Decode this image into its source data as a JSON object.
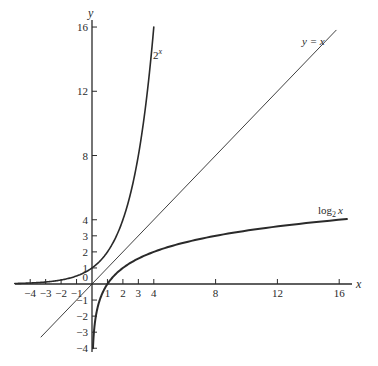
{
  "chart_data": {
    "type": "line",
    "title": "",
    "xlabel": "x",
    "ylabel": "y",
    "xlim": [
      -5,
      17
    ],
    "ylim": [
      -4.2,
      16.5
    ],
    "grid": false,
    "legend": "inline labels",
    "x_ticks": [
      -4,
      -3,
      -2,
      -1,
      1,
      2,
      3,
      4,
      8,
      12,
      16
    ],
    "y_ticks": [
      -4,
      -3,
      -2,
      -1,
      0,
      1,
      2,
      3,
      4,
      8,
      12,
      16
    ],
    "series": [
      {
        "name": "2^x",
        "label_base": "2",
        "label_sup": "x",
        "function": "2^x",
        "x": [
          -5,
          -4,
          -3,
          -2,
          -1,
          0,
          1,
          2,
          3,
          4
        ],
        "y": [
          0.031,
          0.0625,
          0.125,
          0.25,
          0.5,
          1,
          2,
          4,
          8,
          16
        ],
        "stroke_width": 1.6
      },
      {
        "name": "y = x",
        "function": "x",
        "x": [
          -3.3,
          15.8
        ],
        "y": [
          -3.3,
          15.8
        ],
        "stroke_width": 0.9
      },
      {
        "name": "log2 x",
        "label_base": "log",
        "label_sub": "2",
        "label_var": "x",
        "function": "log2(x)",
        "x": [
          0.0625,
          0.125,
          0.25,
          0.5,
          1,
          2,
          4,
          8,
          12,
          16.5
        ],
        "y": [
          -4,
          -3,
          -2,
          -1,
          0,
          1,
          2,
          3,
          3.585,
          4.04
        ],
        "stroke_width": 2.0
      }
    ]
  },
  "labels": {
    "x_axis": "x",
    "y_axis": "y",
    "origin": "0",
    "exp_curve_base": "2",
    "exp_curve_sup": "x",
    "identity_line": "y = x",
    "log_curve_base": "log",
    "log_curve_sub": "2",
    "log_curve_var": "x"
  },
  "colors": {
    "ink": "#2a2a2a",
    "background": "#ffffff"
  }
}
